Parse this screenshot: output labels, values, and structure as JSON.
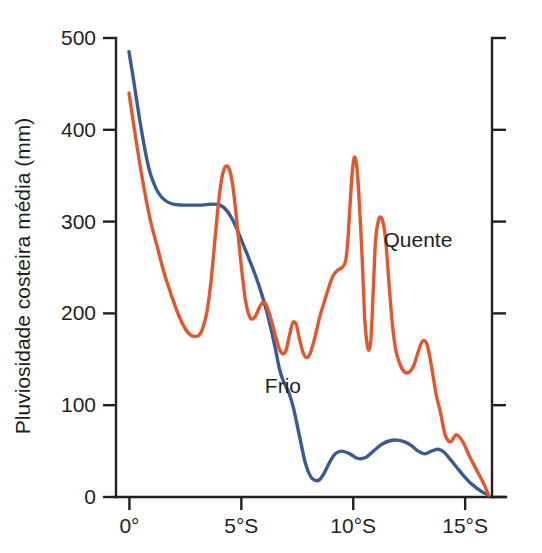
{
  "chart_data": {
    "type": "line",
    "title": "",
    "subtitle": "",
    "xlabel": "",
    "ylabel": "Pluviosidade costeira média (mm)",
    "xlim": [
      -0.6,
      16.2
    ],
    "ylim": [
      0,
      500
    ],
    "grid": false,
    "legend_position": "inline-annotation",
    "x_tick_values": [
      0,
      5,
      10,
      15
    ],
    "x_tick_labels": [
      "0°",
      "5°S",
      "10°S",
      "15°S"
    ],
    "y_tick_values": [
      0,
      100,
      200,
      300,
      400,
      500
    ],
    "y_tick_labels": [
      "0",
      "100",
      "200",
      "300",
      "400",
      "500"
    ],
    "right_axis": {
      "visible": true,
      "labels_visible": false,
      "tick_values": [
        0,
        100,
        200,
        300,
        400,
        500
      ]
    },
    "series": [
      {
        "name": "Frio",
        "color": "#3a5a96",
        "annotation": "Frio",
        "annotation_x": 6.05,
        "annotation_y": 113,
        "x": [
          -0.02,
          0.18,
          0.4,
          0.62,
          0.85,
          1.05,
          1.3,
          1.6,
          1.95,
          2.35,
          2.8,
          3.25,
          3.7,
          4.05,
          4.35,
          4.65,
          4.95,
          5.3,
          5.65,
          5.95,
          6.2,
          6.4,
          6.55,
          6.7,
          6.85,
          7.0,
          7.15,
          7.35,
          7.6,
          7.85,
          8.1,
          8.3,
          8.5,
          8.7,
          8.95,
          9.2,
          9.5,
          9.85,
          10.2,
          10.55,
          10.9,
          11.25,
          11.6,
          11.95,
          12.3,
          12.6,
          12.9,
          13.2,
          13.5,
          13.8,
          14.05,
          14.3,
          14.6,
          14.9,
          15.2,
          15.5,
          15.8,
          16.05
        ],
        "y": [
          485,
          455,
          420,
          388,
          360,
          344,
          331,
          323,
          319,
          318,
          318,
          318,
          319,
          318,
          312,
          300,
          283,
          262,
          240,
          218,
          196,
          175,
          158,
          140,
          128,
          120,
          112,
          95,
          66,
          38,
          22,
          18,
          19,
          26,
          38,
          47,
          50,
          47,
          42,
          43,
          50,
          57,
          61,
          62,
          60,
          56,
          50,
          47,
          50,
          52,
          49,
          42,
          33,
          24,
          16,
          10,
          5,
          2
        ]
      },
      {
        "name": "Quente",
        "color": "#e4572e",
        "annotation": "Quente",
        "annotation_x": 11.35,
        "annotation_y": 272,
        "x": [
          -0.02,
          0.2,
          0.45,
          0.7,
          0.95,
          1.25,
          1.55,
          1.9,
          2.2,
          2.5,
          2.75,
          2.95,
          3.1,
          3.25,
          3.45,
          3.65,
          3.85,
          4.0,
          4.15,
          4.3,
          4.45,
          4.6,
          4.75,
          4.9,
          5.05,
          5.2,
          5.4,
          5.6,
          5.8,
          5.95,
          6.1,
          6.3,
          6.5,
          6.7,
          6.85,
          7.0,
          7.15,
          7.3,
          7.45,
          7.6,
          7.75,
          7.9,
          8.05,
          8.2,
          8.35,
          8.5,
          8.7,
          8.9,
          9.1,
          9.3,
          9.5,
          9.65,
          9.75,
          9.85,
          9.95,
          10.05,
          10.15,
          10.25,
          10.4,
          10.5,
          10.6,
          10.7,
          10.8,
          10.9,
          11.0,
          11.15,
          11.3,
          11.45,
          11.6,
          11.75,
          11.9,
          12.1,
          12.3,
          12.5,
          12.7,
          12.9,
          13.1,
          13.3,
          13.5,
          13.7,
          13.9,
          14.1,
          14.35,
          14.6,
          14.9,
          15.2,
          15.5,
          15.8,
          16.05
        ],
        "y": [
          440,
          404,
          365,
          330,
          300,
          272,
          244,
          218,
          198,
          183,
          176,
          175,
          176,
          182,
          200,
          236,
          288,
          325,
          350,
          360,
          358,
          342,
          312,
          275,
          240,
          212,
          195,
          196,
          206,
          212,
          210,
          196,
          178,
          161,
          156,
          160,
          176,
          190,
          188,
          172,
          158,
          152,
          155,
          166,
          180,
          196,
          212,
          228,
          241,
          247,
          250,
          256,
          276,
          315,
          352,
          370,
          362,
          330,
          260,
          200,
          170,
          160,
          175,
          228,
          280,
          303,
          302,
          280,
          232,
          188,
          160,
          144,
          136,
          136,
          143,
          158,
          170,
          166,
          142,
          112,
          92,
          68,
          60,
          68,
          60,
          44,
          30,
          16,
          2
        ]
      }
    ]
  },
  "axes": {
    "y_axis_title": "Pluviosidade costeira média (mm)"
  }
}
